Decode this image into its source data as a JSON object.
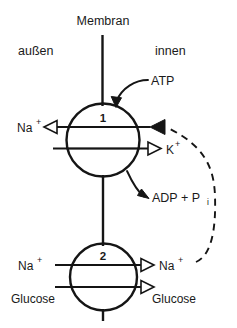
{
  "figure": {
    "title": "Membran",
    "side_labels": {
      "outside": "außen",
      "inside": "innen"
    }
  },
  "transporters": [
    {
      "id": "1",
      "number_label": "1",
      "name": "sodium-potassium-pump",
      "left_label": "Na",
      "left_label_charge": "+",
      "right_label": "K",
      "right_label_charge": "+",
      "substrate_in": "ATP",
      "product_out_main": "ADP + P",
      "product_out_sub": "i"
    },
    {
      "id": "2",
      "number_label": "2",
      "name": "sodium-glucose-cotransporter",
      "left_label_top": "Na",
      "left_label_top_charge": "+",
      "left_label_bottom": "Glucose",
      "right_label_top": "Na",
      "right_label_top_charge": "+",
      "right_label_bottom": "Glucose"
    }
  ],
  "colors": {
    "ink": "#151515",
    "background": "#ffffff",
    "text": "#1a1a1a"
  }
}
